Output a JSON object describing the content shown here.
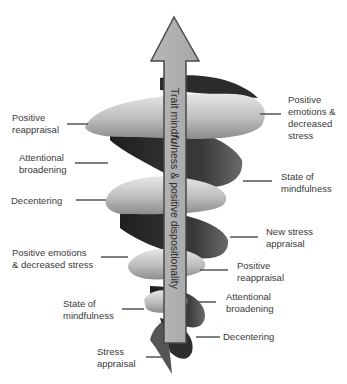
{
  "diagram": {
    "arrow_label": "Trait mindfulness & positive dispositionality",
    "arrow_label_parts": [
      "Trait mind",
      "ful",
      "ness & positive dispositionality"
    ],
    "colors": {
      "arrow_fill": "#b0b0b0",
      "arrow_stroke": "#4a4a4a",
      "spiral_light": "#d4d4d4",
      "spiral_dark": "#2a2a2a",
      "leader_line": "#555555",
      "text": "#3a3a3a"
    },
    "left_labels": [
      {
        "id": "positive-reappraisal-upper",
        "text": "Positive\nreappraisal"
      },
      {
        "id": "attentional-broadening-upper",
        "text": "Attentional\nbroadening"
      },
      {
        "id": "decentering-upper",
        "text": "Decentering"
      },
      {
        "id": "positive-emotions-lower",
        "text": "Positive emotions\n& decreased stress"
      },
      {
        "id": "state-of-mindfulness-lower",
        "text": "State of\nmindfulness"
      },
      {
        "id": "stress-appraisal",
        "text": "Stress\nappraisal"
      }
    ],
    "right_labels": [
      {
        "id": "positive-emotions-upper",
        "text": "Positive\nemotions &\ndecreased\nstress"
      },
      {
        "id": "state-of-mindfulness-upper",
        "text": "State of\nmindfulness"
      },
      {
        "id": "new-stress-appraisal",
        "text": "New stress\nappraisal"
      },
      {
        "id": "positive-reappraisal-lower",
        "text": "Positive\nreappraisal"
      },
      {
        "id": "attentional-broadening-lower",
        "text": "Attentional\nbroadening"
      },
      {
        "id": "decentering-lower",
        "text": "Decentering"
      }
    ]
  }
}
